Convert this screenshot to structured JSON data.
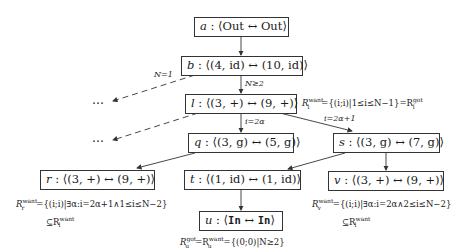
{
  "diagram": {
    "type": "state-transition-graph",
    "nodes": {
      "a": {
        "name": "a",
        "label": "⟨Out ↔ Out⟩"
      },
      "b": {
        "name": "b",
        "label": "⟨(4, id) ↔ (10, id)⟩"
      },
      "l": {
        "name": "l",
        "label": "⟨(3, +) ↔ (9, +)⟩"
      },
      "q": {
        "name": "q",
        "label": "⟨(3, g) ↔ (5, g)⟩"
      },
      "s": {
        "name": "s",
        "label": "⟨(3, g) ↔ (7, g)⟩"
      },
      "r": {
        "name": "r",
        "label": "⟨(3, +) ↔ (9, +)⟩"
      },
      "t": {
        "name": "t",
        "label": "⟨(1, id) ↔ (1, id)⟩"
      },
      "v": {
        "name": "v",
        "label": "⟨(3, +) ↔ (9, +)⟩"
      },
      "u": {
        "name": "u",
        "label_pre": "⟨",
        "in1": "In",
        "arrow": " ↔ ",
        "in2": "In",
        "label_post": "⟩"
      }
    },
    "edges": [
      {
        "from": "a",
        "to": "b",
        "label": ""
      },
      {
        "from": "b",
        "to": "l",
        "label": "N≥2"
      },
      {
        "from": "b",
        "to": "dots1",
        "label": "N=1",
        "style": "dashed"
      },
      {
        "from": "l",
        "to": "dots2",
        "label": "",
        "style": "dashed"
      },
      {
        "from": "l",
        "to": "q",
        "label": "i=2α"
      },
      {
        "from": "l",
        "to": "s",
        "label": "i=2α+1"
      },
      {
        "from": "q",
        "to": "r",
        "label": ""
      },
      {
        "from": "s",
        "to": "t",
        "label": ""
      },
      {
        "from": "s",
        "to": "v",
        "label": ""
      },
      {
        "from": "t",
        "to": "u",
        "label": ""
      }
    ],
    "edge_labels": {
      "b_l": "N≥2",
      "b_dots": "N=1",
      "l_q": "i=2α",
      "l_s": "i=2α+1"
    },
    "ellipsis": "…",
    "annotations": {
      "l": {
        "lhs": "R",
        "lhs_sup": "want",
        "lhs_sub": "l",
        "body": "={(i;i)|1≤i≤N−1}=R",
        "rhs_sup": "got",
        "rhs_sub": "l"
      },
      "r": {
        "line1_lhs": "R",
        "line1_sup": "want",
        "line1_sub": "r",
        "line1_body": "={(i;i)|∃α:i=2α+1∧1≤i≤N−2}",
        "line2": "⊆R",
        "line2_sup": "want",
        "line2_sub": "l"
      },
      "v": {
        "line1_lhs": "R",
        "line1_sup": "want",
        "line1_sub": "v",
        "line1_body": "={(i;i)|∃α:i=2α∧2≤i≤N−2}",
        "line2": "⊆R",
        "line2_sup": "want",
        "line2_sub": "l"
      },
      "u": {
        "lhs": "R",
        "lhs_sup": "got",
        "lhs_sub": "u",
        "mid": "=R",
        "mid_sup": "want",
        "mid_sub": "u",
        "body": "={(0;0)|N≥2}"
      }
    }
  }
}
